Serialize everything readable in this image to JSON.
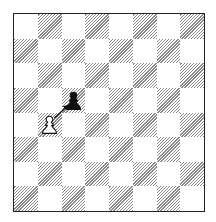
{
  "diagram": {
    "type": "chess-board",
    "files": [
      "a",
      "b",
      "c",
      "d",
      "e",
      "f",
      "g",
      "h"
    ],
    "ranks": [
      "8",
      "7",
      "6",
      "5",
      "4",
      "3",
      "2",
      "1"
    ],
    "light_square_color": "#ffffff",
    "dark_square_color": "#8a8a8a",
    "dark_square_style": "diagonal-hatch",
    "border_color": "#222222",
    "top_left_square": "light",
    "pieces": [
      {
        "square": "c5",
        "color": "black",
        "type": "pawn",
        "icon": "black-pawn-icon"
      },
      {
        "square": "b4",
        "color": "white",
        "type": "pawn",
        "icon": "white-pawn-icon"
      }
    ],
    "arrows": [
      {
        "from": "b4",
        "to": "c5",
        "color": "#111111",
        "meaning": "pawn-capture"
      }
    ]
  }
}
